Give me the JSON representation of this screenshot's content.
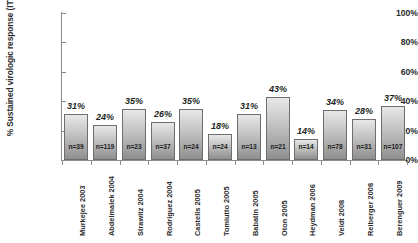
{
  "chart_data": {
    "type": "bar",
    "title": "",
    "xlabel": "",
    "ylabel": "% Sustained virologic response (ITT)",
    "ylim": [
      0,
      100
    ],
    "ytick_labels": [
      "100%",
      "80%",
      "60%",
      "40%",
      "20%",
      "0%"
    ],
    "ytick_values": [
      100,
      80,
      60,
      40,
      20,
      0
    ],
    "grid": false,
    "legend": "none",
    "categories": [
      "Murkejee 2003",
      "Abdelmalek 2004",
      "Strawitz 2004",
      "Rodriguez 2004",
      "Castells 2005",
      "Tomiutto 2005",
      "Babatin 2005",
      "Oton 2005",
      "Heydman 2006",
      "Veldt 2008",
      "Reiberger 2008",
      "Berenguer 2009"
    ],
    "values": [
      31,
      24,
      35,
      26,
      35,
      18,
      31,
      43,
      14,
      34,
      28,
      37
    ],
    "value_labels": [
      "31%",
      "24%",
      "35%",
      "26%",
      "35%",
      "18%",
      "31%",
      "43%",
      "14%",
      "34%",
      "28%",
      "37%"
    ],
    "sample_sizes": [
      "n=39",
      "n=119",
      "n=23",
      "n=37",
      "n=24",
      "n=24",
      "n=13",
      "n=21",
      "n=14",
      "n=78",
      "n=31",
      "n=107"
    ]
  },
  "style": {
    "bar_fill_top": "#e8e8e8",
    "bar_fill_bottom": "#8f8f8f",
    "bar_border": "#6e6e6e",
    "axis_color": "#8d8d8d",
    "text_color": "#231f20",
    "background": "#ffffff"
  }
}
